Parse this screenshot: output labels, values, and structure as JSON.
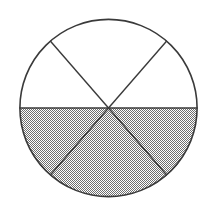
{
  "figure": {
    "type": "fraction-circle-diagram",
    "canvas": {
      "width": 215,
      "height": 216,
      "background": "#ffffff"
    },
    "circle": {
      "center_x": 108.5,
      "center_y": 108.0,
      "radius": 89.0,
      "outline_color": "#3a3a3a",
      "outline_width": 1.6,
      "fill_color": "#ffffff"
    },
    "sectors": {
      "count": 6,
      "sector_angle_degrees": 60,
      "shaded_count": 3,
      "unshaded_count": 3,
      "fraction_shaded": "3/6",
      "shaded_fill_color": "#9c9c9c",
      "unshaded_fill_color": "#ffffff",
      "pattern": "checker-dither",
      "items": [
        {
          "id": "sector-upper-left",
          "start_deg": 180,
          "end_deg": 229,
          "shaded": false
        },
        {
          "id": "sector-upper-middle",
          "start_deg": 229,
          "end_deg": 311,
          "shaded": false
        },
        {
          "id": "sector-upper-right",
          "start_deg": 311,
          "end_deg": 360,
          "shaded": false
        },
        {
          "id": "sector-lower-right",
          "start_deg": 0,
          "end_deg": 49,
          "shaded": true
        },
        {
          "id": "sector-lower-middle",
          "start_deg": 49,
          "end_deg": 131,
          "shaded": true
        },
        {
          "id": "sector-lower-left",
          "start_deg": 131,
          "end_deg": 180,
          "shaded": true
        }
      ]
    },
    "diameters": [
      {
        "id": "diameter-horizontal",
        "angle_deg": 0,
        "x1": 19.5,
        "y1": 108.0,
        "x2": 197.5,
        "y2": 108.0
      },
      {
        "id": "diameter-nw-se",
        "angle_deg": 49,
        "x1": 50.1,
        "y1": 40.8,
        "x2": 166.9,
        "y2": 175.2
      },
      {
        "id": "diameter-ne-sw",
        "angle_deg": 131,
        "x1": 166.9,
        "y1": 40.8,
        "x2": 50.1,
        "y2": 175.2
      }
    ],
    "line_color": "#3a3a3a",
    "line_width": 1.4
  }
}
